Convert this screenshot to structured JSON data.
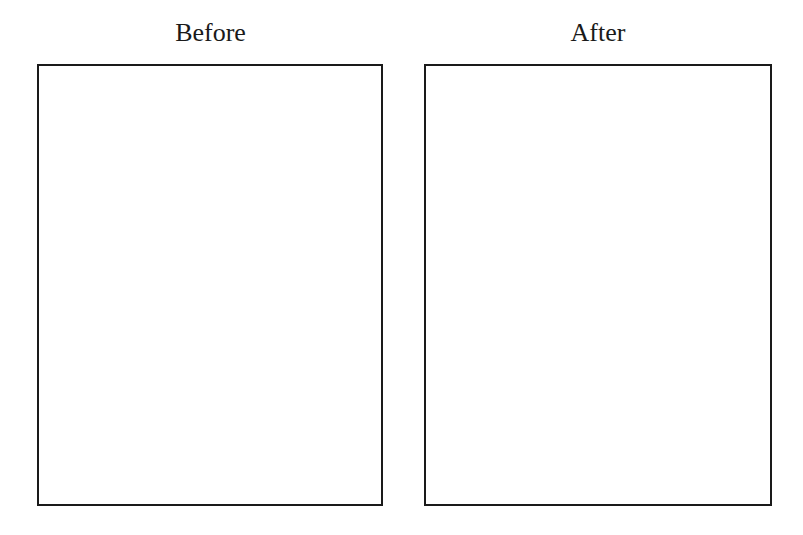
{
  "panels": [
    {
      "title": "Before"
    },
    {
      "title": "After"
    }
  ],
  "colors": {
    "border": "#1a1a1a",
    "background": "#ffffff"
  }
}
